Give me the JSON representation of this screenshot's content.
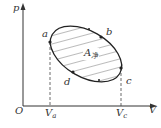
{
  "diagram": {
    "type": "p-V cycle diagram",
    "axes": {
      "y_label": "p",
      "x_label": "V",
      "origin_label": "O"
    },
    "points": [
      {
        "name": "a",
        "label": "a"
      },
      {
        "name": "b",
        "label": "b"
      },
      {
        "name": "c",
        "label": "c"
      },
      {
        "name": "d",
        "label": "d"
      }
    ],
    "area_label": {
      "main": "A",
      "sub": "净"
    },
    "x_ticks": [
      {
        "main": "V",
        "sub": "a"
      },
      {
        "main": "V",
        "sub": "c"
      }
    ],
    "colors": {
      "stroke": "#333333",
      "hatch": "#555555",
      "background": "#ffffff"
    }
  }
}
